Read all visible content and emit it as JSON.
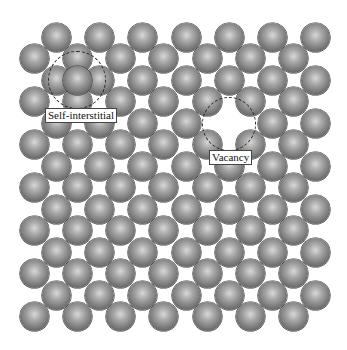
{
  "figure": {
    "atom_diameter": 29,
    "lattice": {
      "rows_type_a": {
        "y": [
          37,
          80,
          123,
          166,
          209,
          252,
          295
        ],
        "x": [
          56,
          99,
          142,
          186,
          229,
          272,
          315
        ]
      },
      "rows_type_b": {
        "y": [
          58,
          101,
          144,
          187,
          230,
          273,
          316
        ],
        "x": [
          34,
          77,
          120,
          163,
          207,
          250,
          293
        ]
      }
    },
    "defects": [
      {
        "type": "self-interstitial",
        "label": "Self-interstitial",
        "atom_x": 77,
        "atom_y": 80,
        "circle": {
          "cx": 77,
          "cy": 80,
          "r": 29
        },
        "label_x": 45,
        "label_y": 108
      },
      {
        "type": "vacancy",
        "label": "Vacancy",
        "missing_x": 229,
        "missing_y": 123,
        "circle": {
          "cx": 229,
          "cy": 124,
          "r": 27
        },
        "label_x": 209,
        "label_y": 150
      }
    ]
  },
  "labels": {
    "interstitial": "Self-interstitial",
    "vacancy": "Vacancy"
  },
  "colors": {
    "atom_highlight": "#d8d8d8",
    "atom_mid": "#a6a6a6",
    "atom_dark": "#4a4a4a",
    "background": "#ffffff",
    "dash": "#222222"
  }
}
